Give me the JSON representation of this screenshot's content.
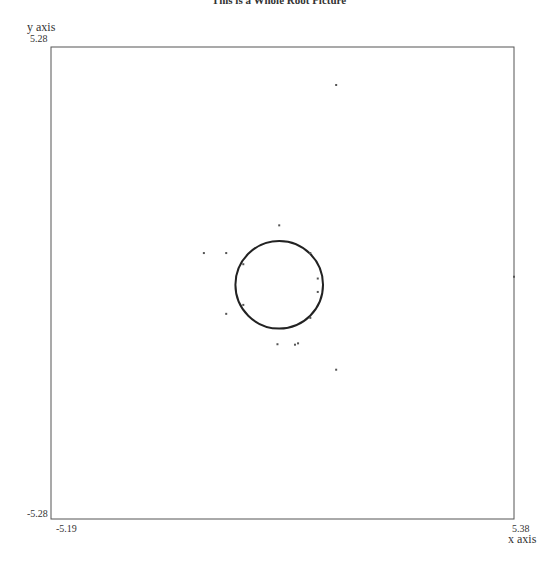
{
  "chart_data": {
    "type": "scatter",
    "title": "This is a Whole Root Picture",
    "xlabel": "x axis",
    "ylabel": "y axis",
    "xlim": [
      -5.19,
      5.38
    ],
    "ylim": [
      -5.28,
      5.28
    ],
    "tick_labels": {
      "x_min": "-5.19",
      "x_max": "5.38",
      "y_min": "-5.28",
      "y_max": "5.28"
    },
    "grid": false,
    "legend": null,
    "series": [
      {
        "name": "root-locus-circle",
        "kind": "curve",
        "description": "circle of roots centered near origin",
        "center": [
          0.02,
          -0.04
        ],
        "radius": 1.0
      },
      {
        "name": "roots",
        "kind": "points",
        "points": [
          [
            1.32,
            4.43
          ],
          [
            1.32,
            -1.94
          ],
          [
            -1.7,
            0.67
          ],
          [
            5.38,
            0.14
          ],
          [
            0.02,
            1.29
          ],
          [
            -0.02,
            -1.37
          ],
          [
            -1.19,
            0.67
          ],
          [
            -1.19,
            -0.69
          ],
          [
            0.73,
            0.67
          ],
          [
            0.73,
            -0.78
          ],
          [
            -0.8,
            0.42
          ],
          [
            -0.8,
            -0.49
          ],
          [
            0.9,
            0.1
          ],
          [
            0.9,
            -0.2
          ],
          [
            0.45,
            -1.35
          ],
          [
            0.38,
            -1.38
          ]
        ]
      }
    ]
  },
  "labels": {
    "title": "This is a Whole Root Picture",
    "y_axis_name": "y axis",
    "y_max": "5.28",
    "y_min": "-5.28",
    "x_min": "-5.19",
    "x_max": "5.38",
    "x_axis_name": "x axis"
  }
}
